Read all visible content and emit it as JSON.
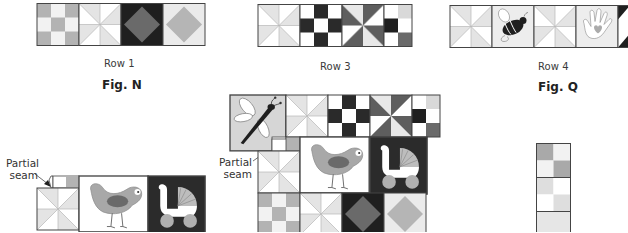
{
  "figures": {
    "fig_n": {
      "label": "Fig. N",
      "row_label": "Row 1"
    },
    "row3": {
      "row_label": "Row 3"
    },
    "fig_q": {
      "label": "Fig. Q",
      "row_label": "Row 4"
    }
  },
  "annotations": {
    "left_partial_seam": {
      "line1": "Partial",
      "line2": "seam"
    },
    "center_partial_seam": {
      "line1": "Partial",
      "line2": "seam"
    }
  },
  "colors": {
    "outline": "#444444",
    "light_gray": "#d9d9d9",
    "mid_gray": "#a9a9a9",
    "dark_gray": "#5e5e5e",
    "black": "#1f1f1f",
    "white": "#ffffff",
    "pale": "#ececec"
  },
  "blocks": {
    "row1": [
      "nine-patch-gray",
      "pinwheel-light",
      "square-in-square-dark",
      "square-in-square-light"
    ],
    "row3": [
      "pinwheel-light",
      "nine-patch-black",
      "pinwheel-dark",
      "four-patch-mixed"
    ],
    "row4": [
      "pinwheel-light",
      "bee-applique",
      "pinwheel-light",
      "hand-heart-applique",
      "partial-triangle-dark"
    ],
    "left_assembly": [
      "pinwheel-light",
      "bird-applique",
      "baby-carriage-applique"
    ],
    "center_assembly": [
      "dragonfly-applique",
      "pinwheel-light",
      "nine-patch-black",
      "pinwheel-dark",
      "four-patch-mixed",
      "pinwheel-light",
      "bird-applique",
      "baby-carriage-applique",
      "nine-patch-gray",
      "pinwheel-light",
      "square-in-square-dark",
      "square-in-square-light"
    ],
    "right_strip": [
      "four-patch-gray",
      "four-patch-light",
      "plain-light"
    ]
  }
}
